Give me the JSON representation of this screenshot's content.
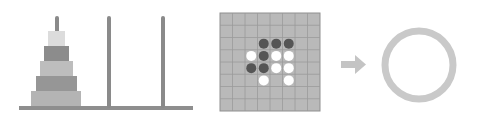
{
  "panels": [
    {
      "name": "tower-of-hanoi",
      "pegs": 3,
      "disks": 5
    },
    {
      "name": "othello-board",
      "grid": "8x8",
      "pieces": [
        {
          "row": 2,
          "col": 3,
          "color": "black"
        },
        {
          "row": 2,
          "col": 4,
          "color": "black"
        },
        {
          "row": 2,
          "col": 5,
          "color": "black"
        },
        {
          "row": 3,
          "col": 2,
          "color": "white"
        },
        {
          "row": 3,
          "col": 3,
          "color": "black"
        },
        {
          "row": 3,
          "col": 4,
          "color": "white"
        },
        {
          "row": 3,
          "col": 5,
          "color": "white"
        },
        {
          "row": 4,
          "col": 2,
          "color": "black"
        },
        {
          "row": 4,
          "col": 3,
          "color": "black"
        },
        {
          "row": 4,
          "col": 4,
          "color": "white"
        },
        {
          "row": 4,
          "col": 5,
          "color": "white"
        },
        {
          "row": 5,
          "col": 3,
          "color": "white"
        },
        {
          "row": 5,
          "col": 5,
          "color": "white"
        }
      ]
    },
    {
      "name": "arrow",
      "direction": "right"
    },
    {
      "name": "empty-circle"
    }
  ],
  "colors": {
    "base": "#8e8e8e",
    "peg": "#8a8a8a",
    "disks": [
      "#dcdcdc",
      "#8c8c8c",
      "#bdbdbd",
      "#969696",
      "#b4b4b4"
    ],
    "board": "#b9b9b9",
    "gridline": "#8f8f8f",
    "black_piece": "#555555",
    "white_piece": "#ffffff",
    "arrow": "#c4c4c4",
    "circle": "#c9c9c9"
  }
}
